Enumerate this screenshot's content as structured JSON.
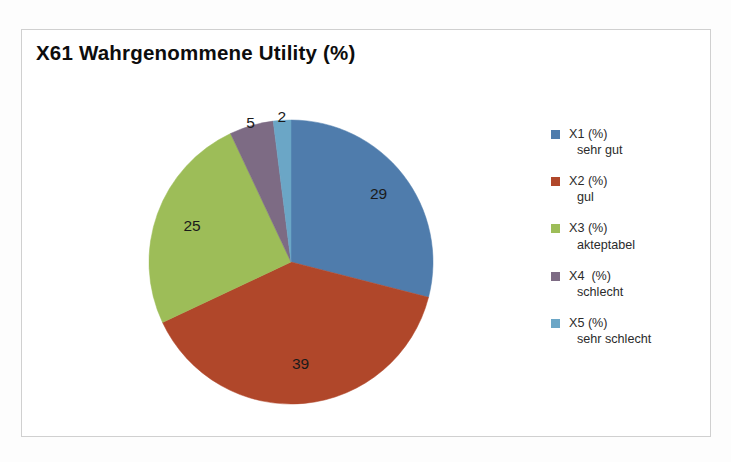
{
  "chart_data": {
    "type": "pie",
    "title": "X61 Wahrgenommene Utility (%)",
    "xlabel": "",
    "ylabel": "",
    "legend_position": "right",
    "grid": false,
    "start_angle_deg": 0,
    "direction": "clockwise",
    "categories": [
      "X1 (%) sehr gut",
      "X2 (%) gul",
      "X3 (%) akteptabel",
      "X4  (%) schlecht",
      "X5 (%) sehr schlecht"
    ],
    "values": [
      29,
      39,
      25,
      5,
      2
    ],
    "data_labels": [
      "29",
      "39",
      "25",
      "5",
      "2"
    ],
    "colors": [
      "#4f7cac",
      "#b0472a",
      "#9dbd58",
      "#7d6b84",
      "#6ba6c6"
    ],
    "total": 100,
    "slices": [
      {
        "label": "X1 (%) sehr gut",
        "value": 29,
        "color": "#4f7cac"
      },
      {
        "label": "X2 (%) gul",
        "value": 39,
        "color": "#b0472a"
      },
      {
        "label": "X3 (%) akteptabel",
        "value": 25,
        "color": "#9dbd58"
      },
      {
        "label": "X4  (%) schlecht",
        "value": 5,
        "color": "#7d6b84"
      },
      {
        "label": "X5 (%) sehr schlecht",
        "value": 2,
        "color": "#6ba6c6"
      }
    ]
  },
  "chart": {
    "title": "X61 Wahrgenommene Utility (%)"
  },
  "legend": {
    "items": [
      {
        "line1": "X1 (%)",
        "line2": "sehr gut",
        "color": "#4f7cac"
      },
      {
        "line1": "X2 (%)",
        "line2": "gul",
        "color": "#b0472a"
      },
      {
        "line1": "X3 (%)",
        "line2": "akteptabel",
        "color": "#9dbd58"
      },
      {
        "line1": "X4  (%)",
        "line2": "schlecht",
        "color": "#7d6b84"
      },
      {
        "line1": "X5 (%)",
        "line2": "sehr schlecht",
        "color": "#6ba6c6"
      }
    ]
  }
}
